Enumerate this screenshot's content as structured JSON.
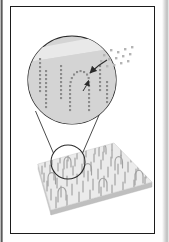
{
  "figure": {
    "title_visible": false,
    "caption_visible": false,
    "frame": {
      "border_color": "#1b1b1b",
      "background": "#ffffff"
    },
    "colors": {
      "inset_fill": "#d4d4d4",
      "inset_highlight": "#e9e9e9",
      "substrate_fill": "#ebebeb",
      "substrate_edge": "#d2d2d2",
      "substrate_side": "#c9c9c9",
      "chain_dot": "#8b8b8b",
      "free_particle": "#b4b4b4",
      "outline": "#2a2a2a",
      "rod": "#a9a9a9"
    },
    "elements": {
      "substrate_label": "substrate-plane",
      "magnifier_label": "magnified-inset-circle",
      "focus_label": "focus-circle-on-substrate",
      "cone_label": "magnifier-connector-lines",
      "arrow_label": "deposition-arrow",
      "particles_label": "free-particles-cloud",
      "loop_label": "polymer-loop-chain",
      "rods_label": "surface-grafted-chains"
    },
    "counts": {
      "free_particles": 14,
      "inset_chain_columns": 7,
      "substrate_rods": 64,
      "substrate_loops": 9
    }
  }
}
